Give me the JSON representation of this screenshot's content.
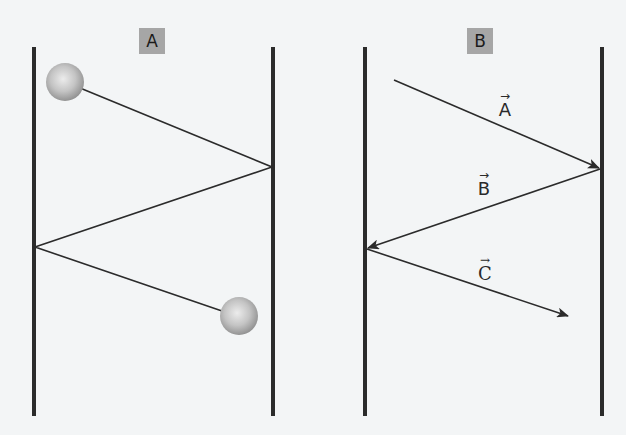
{
  "panels": [
    {
      "id": "A",
      "label": "A",
      "content": "ball bouncing between two walls"
    },
    {
      "id": "B",
      "label": "B",
      "content": "velocity vectors between two walls"
    }
  ],
  "vectors": {
    "a": {
      "symbol": "A",
      "arrow": "→"
    },
    "b": {
      "symbol": "B",
      "arrow": "→"
    },
    "c": {
      "symbol": "C",
      "arrow": "→"
    }
  },
  "colors": {
    "background": "#f3f5f6",
    "wall": "#2b2b2b",
    "path": "#2b2b2b",
    "label_box": "#a6a6a6",
    "ball_light": "#e4e4e4",
    "ball_dark": "#8f8f8f"
  }
}
